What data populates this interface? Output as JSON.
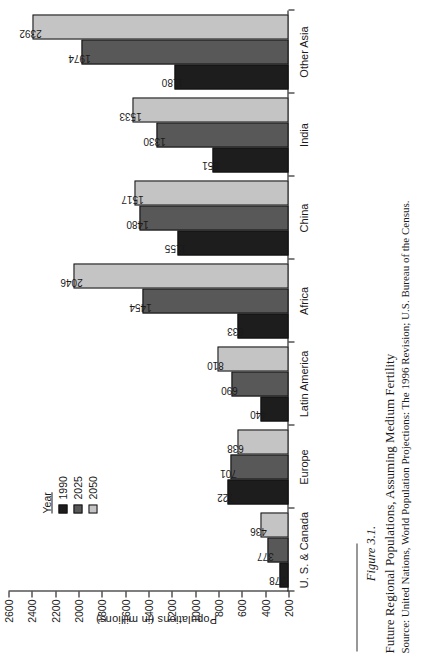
{
  "chart_data": {
    "type": "bar",
    "orientation": "vertical",
    "title": "Future Regional Populations, Assuming Medium Fertility",
    "figure_number": "Figure 3.1.",
    "xlabel": "",
    "ylabel": "Populations (in millions)",
    "ylim": [
      200,
      2600
    ],
    "ytick_step": 200,
    "yticks": [
      2600,
      2400,
      2200,
      2000,
      1800,
      1600,
      1400,
      1200,
      1000,
      800,
      600,
      400,
      200
    ],
    "grid": false,
    "legend_position": "upper-left",
    "legend_title": "Year",
    "categories": [
      "U. S. & Canada",
      "Europe",
      "Latin America",
      "Africa",
      "China",
      "India",
      "Other Asia"
    ],
    "series": [
      {
        "name": "1990",
        "color": "#1d1d1d",
        "values": [
          278,
          722,
          440,
          633,
          1155,
          851,
          1180
        ]
      },
      {
        "name": "2025",
        "color": "#585858",
        "values": [
          377,
          701,
          690,
          1454,
          1480,
          1330,
          1974
        ]
      },
      {
        "name": "2050",
        "color": "#c4c4c4",
        "values": [
          436,
          638,
          810,
          2046,
          1517,
          1533,
          2392
        ]
      }
    ]
  },
  "caption": {
    "figure_label": "Figure 3.1.",
    "title": "Future Regional Populations, Assuming Medium Fertility",
    "source": "Source: United Nations, World Population Projections: The 1996 Revision; U.S. Bureau of the Census."
  }
}
